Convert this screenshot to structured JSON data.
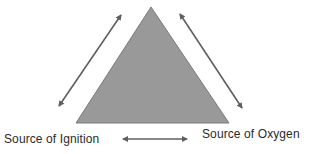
{
  "diagram": {
    "type": "fire-triangle",
    "shape": "triangle",
    "labels": {
      "bottom_left": "Source of Ignition",
      "bottom_right": "Source of Oxygen"
    },
    "arrows": [
      {
        "name": "left-side-arrow",
        "direction": "bidirectional",
        "side": "left"
      },
      {
        "name": "right-side-arrow",
        "direction": "bidirectional",
        "side": "right"
      },
      {
        "name": "bottom-arrow",
        "direction": "bidirectional",
        "side": "bottom"
      }
    ],
    "colors": {
      "triangle_fill": "#999999",
      "triangle_stroke": "#7a7a7a",
      "arrow": "#5f5f5f",
      "text": "#2a2a2a",
      "background": "#ffffff"
    }
  }
}
